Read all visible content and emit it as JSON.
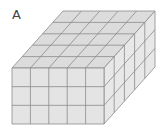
{
  "figure": {
    "label": "A",
    "dimensions": {
      "width": 5,
      "height": 3,
      "depth": 5
    },
    "colors": {
      "face": "#e4e4e4",
      "top": "#dcdcdc",
      "side": "#e8e8e8",
      "line": "#8a8a8a"
    }
  }
}
